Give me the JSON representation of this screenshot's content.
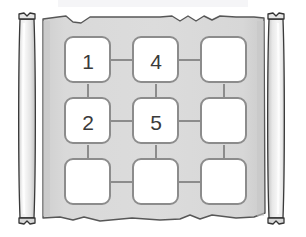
{
  "diagram": {
    "type": "node-grid-on-scroll",
    "scroll": {
      "parchment_label": "parchment-sheet",
      "parchment_color": "#d8d8d8",
      "parchment_edge_color": "#555555",
      "roller_label": "scroll-roller",
      "roller_color": "#ececec",
      "roller_edge_color": "#333333",
      "left_roller_name": "left-roller",
      "right_roller_name": "right-roller"
    },
    "grid": {
      "rows": 3,
      "cols": 3,
      "node_fill": "#ffffff",
      "node_stroke": "#8c8c8c",
      "connector_color": "#8c8c8c",
      "nodes": [
        {
          "row": 0,
          "col": 0,
          "label": "1",
          "name": "node-r1c1"
        },
        {
          "row": 0,
          "col": 1,
          "label": "4",
          "name": "node-r1c2"
        },
        {
          "row": 0,
          "col": 2,
          "label": "",
          "name": "node-r1c3"
        },
        {
          "row": 1,
          "col": 0,
          "label": "2",
          "name": "node-r2c1"
        },
        {
          "row": 1,
          "col": 1,
          "label": "5",
          "name": "node-r2c2"
        },
        {
          "row": 1,
          "col": 2,
          "label": "",
          "name": "node-r2c3"
        },
        {
          "row": 2,
          "col": 0,
          "label": "",
          "name": "node-r3c1"
        },
        {
          "row": 2,
          "col": 1,
          "label": "",
          "name": "node-r3c2"
        },
        {
          "row": 2,
          "col": 2,
          "label": "",
          "name": "node-r3c3"
        }
      ],
      "connectors": [
        "r1c1-r1c2",
        "r1c2-r1c3",
        "r2c1-r2c2",
        "r2c2-r2c3",
        "r3c1-r3c2",
        "r3c2-r3c3",
        "r1c1-r2c1",
        "r2c1-r3c1",
        "r1c2-r2c2",
        "r2c2-r3c2",
        "r1c3-r2c3",
        "r2c3-r3c3"
      ]
    }
  }
}
